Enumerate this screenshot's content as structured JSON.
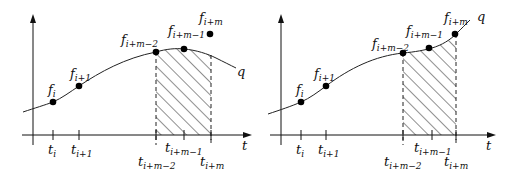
{
  "panels": [
    {
      "name": "left",
      "curve_label": "q",
      "axis_label": "t",
      "points": [
        {
          "label": "f",
          "sub": "i"
        },
        {
          "label": "f",
          "sub": "i+1"
        },
        {
          "label": "f",
          "sub": "i+m−2"
        },
        {
          "label": "f",
          "sub": "i+m−1"
        },
        {
          "label": "f",
          "sub": "i+m"
        }
      ],
      "ticks": [
        {
          "label": "t",
          "sub": "i"
        },
        {
          "label": "t",
          "sub": "i+1"
        },
        {
          "label": "t",
          "sub": "i+m−2"
        },
        {
          "label": "t",
          "sub": "i+m−1"
        },
        {
          "label": "t",
          "sub": "i+m"
        }
      ]
    },
    {
      "name": "right",
      "curve_label": "q",
      "axis_label": "t",
      "points": [
        {
          "label": "f",
          "sub": "i"
        },
        {
          "label": "f",
          "sub": "i+1"
        },
        {
          "label": "f",
          "sub": "i+m−2"
        },
        {
          "label": "f",
          "sub": "i+m−1"
        },
        {
          "label": "f",
          "sub": "i+m"
        }
      ],
      "ticks": [
        {
          "label": "t",
          "sub": "i"
        },
        {
          "label": "t",
          "sub": "i+1"
        },
        {
          "label": "t",
          "sub": "i+m−2"
        },
        {
          "label": "t",
          "sub": "i+m−1"
        },
        {
          "label": "t",
          "sub": "i+m"
        }
      ]
    }
  ]
}
